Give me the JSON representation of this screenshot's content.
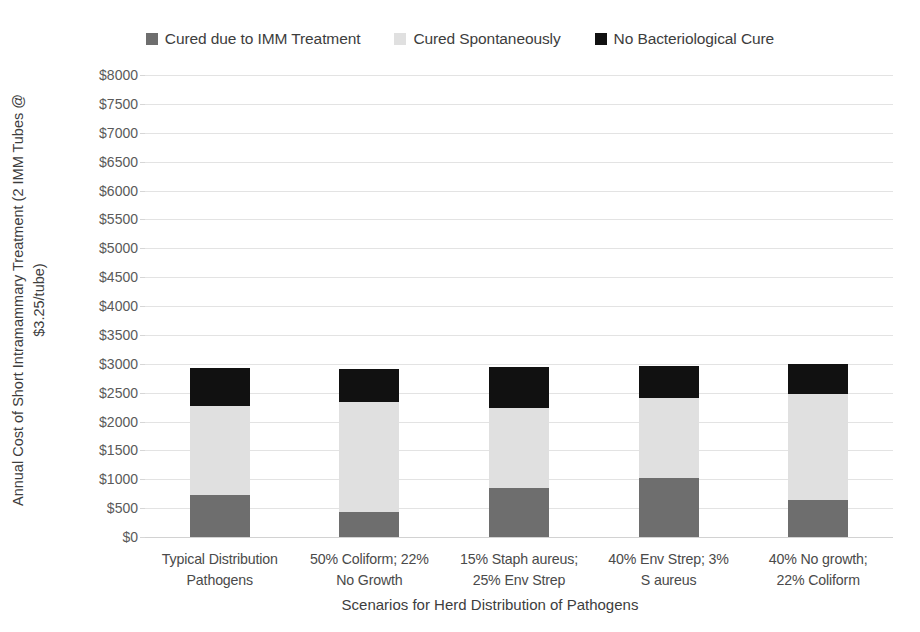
{
  "chart_data": {
    "type": "bar",
    "subtype": "stacked-column",
    "title": "",
    "xlabel": "Scenarios for Herd Distribution of Pathogens",
    "ylabel": "Annual Cost of Short Intramammary Treatment (2 IMM Tubes @ $3.25/tube)",
    "ylabel_line1": "Annual Cost of Short Intramammary Treatment (2 IMM Tubes @",
    "ylabel_line2": "$3.25/tube)",
    "ylim": [
      0,
      8000
    ],
    "ytick_step": 500,
    "ytick_labels": [
      "$8000",
      "$7500",
      "$7000",
      "$6500",
      "$6000",
      "$5500",
      "$5000",
      "$4500",
      "$4000",
      "$3500",
      "$3000",
      "$2500",
      "$2000",
      "$1500",
      "$1000",
      "$500",
      "$0"
    ],
    "ytick_values": [
      8000,
      7500,
      7000,
      6500,
      6000,
      5500,
      5000,
      4500,
      4000,
      3500,
      3000,
      2500,
      2000,
      1500,
      1000,
      500,
      0
    ],
    "grid": true,
    "legend_position": "top",
    "categories": [
      "Typical Distribution Pathogens",
      "50% Coliform; 22% No Growth",
      "15% Staph aureus; 25% Env Strep",
      "40% Env Strep; 3% S aureus",
      "40% No growth; 22% Coliform"
    ],
    "category_lines": [
      [
        "Typical Distribution",
        "Pathogens"
      ],
      [
        "50% Coliform; 22%",
        "No Growth"
      ],
      [
        "15% Staph aureus;",
        "25% Env Strep"
      ],
      [
        "40% Env Strep; 3%",
        "S aureus"
      ],
      [
        "40% No growth;",
        "22% Coliform"
      ]
    ],
    "series": [
      {
        "name": "Cured due to IMM Treatment",
        "color": "#6e6e6e",
        "values": [
          730,
          430,
          850,
          1020,
          640
        ]
      },
      {
        "name": "Cured Spontaneously",
        "color": "#e0e0e0",
        "values": [
          1540,
          1900,
          1390,
          1390,
          1840
        ]
      },
      {
        "name": "No Bacteriological Cure",
        "color": "#111111",
        "values": [
          660,
          580,
          710,
          560,
          520
        ]
      }
    ],
    "totals": [
      2930,
      2910,
      2950,
      2970,
      3000
    ]
  },
  "colors": {
    "background": "#ffffff",
    "grid": "#e3e3e3",
    "text": "#3d3d3d",
    "tick_text": "#5a5a5a"
  }
}
